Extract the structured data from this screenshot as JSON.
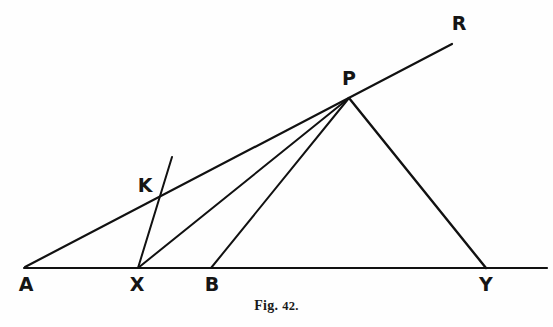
{
  "figure": {
    "caption_prefix": "Fig.",
    "caption_number": "42.",
    "background_color": "#fefefe",
    "ink_color": "#111111",
    "width": 553,
    "height": 327
  },
  "labels": {
    "a": "A",
    "x": "X",
    "b": "B",
    "y": "Y",
    "k": "K",
    "p": "P",
    "r": "R"
  },
  "points": {
    "A": {
      "x": 25,
      "y": 267,
      "label_x": 26,
      "label_y": 284
    },
    "X": {
      "x": 138,
      "y": 268,
      "label_x": 137,
      "label_y": 284
    },
    "B": {
      "x": 211,
      "y": 268,
      "label_x": 212,
      "label_y": 284
    },
    "Y": {
      "x": 486,
      "y": 268,
      "label_x": 486,
      "label_y": 284
    },
    "K": {
      "x": 163,
      "y": 192,
      "label_x": 145,
      "label_y": 185
    },
    "P": {
      "x": 349,
      "y": 98,
      "label_x": 349,
      "label_y": 78
    },
    "R": {
      "x": 452,
      "y": 44,
      "label_x": 459,
      "label_y": 23
    }
  },
  "segments": [
    {
      "name": "baseline-A-Y",
      "from": [
        24,
        268
      ],
      "to": [
        547,
        268
      ],
      "width": 2.2
    },
    {
      "name": "ray-A-through-K-to-R",
      "from": [
        25,
        267
      ],
      "to": [
        452,
        44
      ],
      "width": 2.2
    },
    {
      "name": "ray-X-through-K",
      "from": [
        138,
        268
      ],
      "to": [
        172,
        157
      ],
      "width": 2.0
    },
    {
      "name": "line-X-to-P",
      "from": [
        138,
        268
      ],
      "to": [
        349,
        98
      ],
      "width": 2.0
    },
    {
      "name": "line-B-to-P",
      "from": [
        211,
        268
      ],
      "to": [
        349,
        98
      ],
      "width": 2.0
    },
    {
      "name": "line-P-to-Y",
      "from": [
        349,
        98
      ],
      "to": [
        486,
        268
      ],
      "width": 2.4
    }
  ]
}
